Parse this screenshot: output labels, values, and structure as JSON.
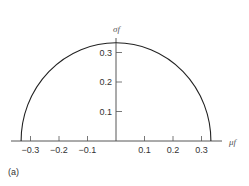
{
  "chart_data": {
    "type": "line",
    "title": "",
    "panel_label": "(a)",
    "xlabel": "μf",
    "ylabel": "σf",
    "xlim": [
      -0.38,
      0.38
    ],
    "ylim": [
      0,
      0.35
    ],
    "grid": false,
    "x_ticks": [
      -0.3,
      -0.2,
      -0.1,
      0.1,
      0.2,
      0.3
    ],
    "x_tick_labels": [
      "−0.3",
      "−0.2",
      "−0.1",
      "0.1",
      "0.2",
      "0.3"
    ],
    "y_ticks": [
      0.1,
      0.2,
      0.3
    ],
    "y_tick_labels": [
      "0.1",
      "0.2",
      "0.3"
    ],
    "series": [
      {
        "name": "semicircle",
        "description": "Upper half circle centered at origin, radius ≈ 1/3",
        "radius": 0.333,
        "x": [
          -0.333,
          -0.3,
          -0.2,
          -0.1,
          0,
          0.1,
          0.2,
          0.3,
          0.333
        ],
        "y": [
          0,
          0.145,
          0.266,
          0.318,
          0.333,
          0.318,
          0.266,
          0.145,
          0
        ]
      }
    ]
  }
}
